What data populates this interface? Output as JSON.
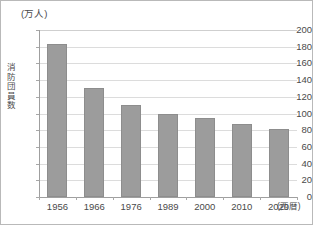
{
  "chart_data": {
    "type": "bar",
    "title": "",
    "unit_caption": "(万人)",
    "ylabel": "消防団員数",
    "xlabel": "(西暦)",
    "categories": [
      "1956",
      "1966",
      "1976",
      "1989",
      "2000",
      "2010",
      "2020"
    ],
    "values": [
      183,
      130,
      110,
      100,
      95,
      88,
      81
    ],
    "ylim": [
      0,
      200
    ],
    "ytick_labels": [
      "200",
      "180",
      "160",
      "140",
      "120",
      "100",
      "80",
      "60",
      "40",
      "20",
      "0"
    ],
    "ytick_values": [
      200,
      180,
      160,
      140,
      120,
      100,
      80,
      60,
      40,
      20,
      0
    ],
    "grid": true,
    "legend": "none",
    "series_color": "#9c9c9c",
    "gridline_color": "#dcdcdc",
    "axis_color": "#9f9f9f",
    "text_color": "#4a4a4a",
    "border_color": "#b9b9b9"
  }
}
